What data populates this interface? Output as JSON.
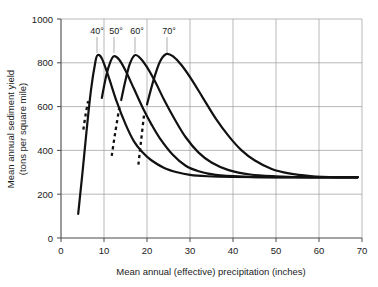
{
  "chart_data": {
    "type": "line",
    "title": "",
    "xlabel": "Mean annual (effective) precipitation (inches)",
    "ylabel_line1": "Mean annual sediment yield",
    "ylabel_line2": "(tons per square mile)",
    "xlim": [
      0,
      70
    ],
    "ylim": [
      0,
      1000
    ],
    "xticks": [
      0,
      10,
      20,
      30,
      40,
      50,
      60,
      70
    ],
    "yticks": [
      0,
      200,
      400,
      600,
      800,
      1000
    ],
    "xtick_labels": [
      "0",
      "10",
      "20",
      "30",
      "40",
      "50",
      "60",
      "70"
    ],
    "ytick_labels": [
      "0",
      "200",
      "400",
      "600",
      "800",
      "1000"
    ],
    "grid": true,
    "legend_position": "inline-above-peaks",
    "annotations": [
      "40°",
      "50°",
      "60°",
      "70°"
    ],
    "series": [
      {
        "name": "40°",
        "label": "40°",
        "style": "solid",
        "peak_x": 8.5,
        "peak_y": 835,
        "asymptote_y": 280,
        "x": [
          4.0,
          5.0,
          6.0,
          7.0,
          8.0,
          8.5,
          9.5,
          11.0,
          13.0,
          15.0,
          17.0,
          19.0,
          21.0,
          24.0,
          27.0,
          30.0,
          34.0,
          40.0,
          50.0,
          60.0,
          69.0
        ],
        "y": [
          110,
          300,
          500,
          680,
          805,
          835,
          820,
          740,
          620,
          520,
          440,
          390,
          355,
          320,
          300,
          288,
          282,
          279,
          278,
          278,
          278
        ]
      },
      {
        "name": "50°",
        "label": "50°",
        "style": "solid",
        "peak_x": 12.3,
        "peak_y": 830,
        "asymptote_y": 280,
        "x": [
          9.5,
          10.5,
          11.5,
          12.3,
          13.5,
          15.0,
          17.0,
          19.0,
          21.0,
          23.0,
          26.0,
          29.0,
          32.0,
          36.0,
          42.0,
          50.0,
          60.0,
          69.0
        ],
        "y": [
          640,
          740,
          805,
          830,
          815,
          765,
          680,
          595,
          520,
          455,
          380,
          330,
          305,
          288,
          280,
          277,
          277,
          277
        ]
      },
      {
        "name": "60°",
        "label": "60°",
        "style": "solid",
        "peak_x": 17.2,
        "peak_y": 835,
        "asymptote_y": 278,
        "x": [
          14.0,
          15.0,
          16.0,
          17.2,
          18.5,
          20.0,
          22.0,
          24.0,
          26.5,
          29.0,
          32.0,
          35.0,
          39.0,
          44.0,
          50.0,
          58.0,
          69.0
        ],
        "y": [
          630,
          720,
          795,
          835,
          820,
          780,
          710,
          630,
          540,
          460,
          390,
          345,
          310,
          290,
          282,
          277,
          277
        ]
      },
      {
        "name": "70°",
        "label": "70°",
        "style": "solid",
        "peak_x": 24.5,
        "peak_y": 840,
        "asymptote_y": 278,
        "x": [
          20.0,
          21.5,
          23.0,
          24.5,
          26.0,
          28.0,
          30.5,
          33.0,
          36.0,
          39.0,
          42.0,
          45.0,
          49.0,
          53.0,
          58.0,
          64.0,
          69.0
        ],
        "y": [
          610,
          720,
          805,
          840,
          830,
          790,
          720,
          640,
          545,
          465,
          400,
          355,
          315,
          295,
          283,
          277,
          277
        ]
      },
      {
        "name": "40°-extension",
        "label": "",
        "style": "dashed",
        "x": [
          5.2,
          5.7,
          6.3
        ],
        "y": [
          495,
          560,
          625
        ]
      },
      {
        "name": "50°-extension",
        "label": "",
        "style": "dashed",
        "x": [
          11.8,
          12.6,
          13.6
        ],
        "y": [
          375,
          480,
          600
        ]
      },
      {
        "name": "60°-extension",
        "label": "",
        "style": "dashed",
        "x": [
          18.0,
          18.6,
          19.3
        ],
        "y": [
          335,
          440,
          560
        ]
      }
    ]
  }
}
